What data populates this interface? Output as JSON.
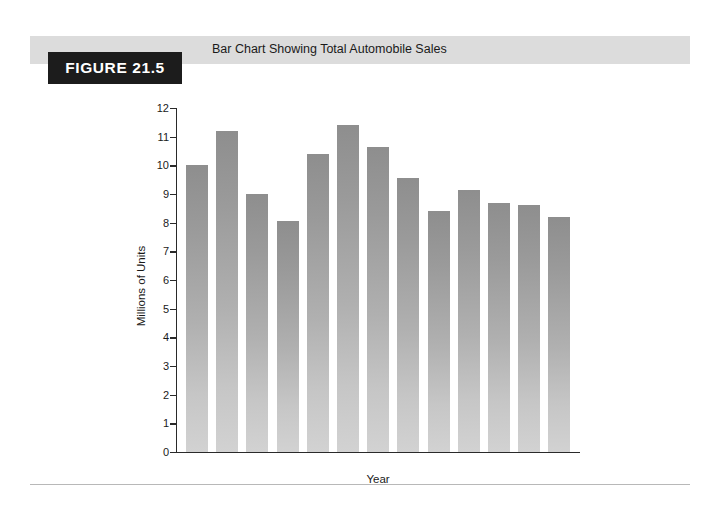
{
  "figure": {
    "badge_label": "FIGURE 21.5",
    "title": "Bar Chart Showing Total Automobile Sales",
    "banner_color": "#dcdcdc",
    "badge_color": "#1c1c1c"
  },
  "chart_data": {
    "type": "bar",
    "title": "Bar Chart Showing Total Automobile Sales",
    "xlabel": "Year",
    "ylabel": "Millions of Units",
    "categories": [
      "2",
      "4",
      "6",
      "8",
      "10",
      "12",
      "14",
      "16",
      "18",
      "20",
      "22",
      "24",
      "26"
    ],
    "values": [
      10.0,
      11.2,
      9.0,
      8.05,
      10.4,
      11.4,
      10.65,
      9.55,
      8.4,
      9.15,
      8.7,
      8.6,
      8.2
    ],
    "ylim": [
      0,
      12
    ],
    "ytick_labels": [
      "0",
      "1",
      "2",
      "3",
      "4",
      "5",
      "6",
      "7",
      "8",
      "9",
      "10",
      "11",
      "12"
    ],
    "ytick_values": [
      0,
      1,
      2,
      3,
      4,
      5,
      6,
      7,
      8,
      9,
      10,
      11,
      12
    ],
    "grid": false,
    "legend": "none",
    "bar_color_top": "#8e8e8e",
    "bar_color_bottom": "#d2d2d2"
  }
}
